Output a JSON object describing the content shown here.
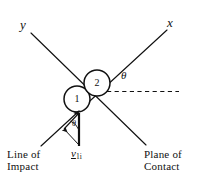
{
  "figure": {
    "title_alt": "Oblique central impact of two balls",
    "background_color": "#ffffff",
    "stroke_color": "#111111"
  },
  "axes": {
    "y_label": "y",
    "x_label": "x"
  },
  "bodies": [
    {
      "id": "ball-1",
      "label": "1",
      "cx": 77,
      "cy": 99,
      "r": 13
    },
    {
      "id": "ball-2",
      "label": "2",
      "cx": 97,
      "cy": 83,
      "r": 13
    }
  ],
  "angles": {
    "theta_plane": "θ",
    "theta_velocity": "θ"
  },
  "velocity": {
    "symbol": "v",
    "subscript": "1i"
  },
  "captions": {
    "line_of_impact": {
      "line1": "Line of",
      "line2": "Impact"
    },
    "plane_of_contact": {
      "line1": "Plane of",
      "line2": "Contact"
    }
  }
}
